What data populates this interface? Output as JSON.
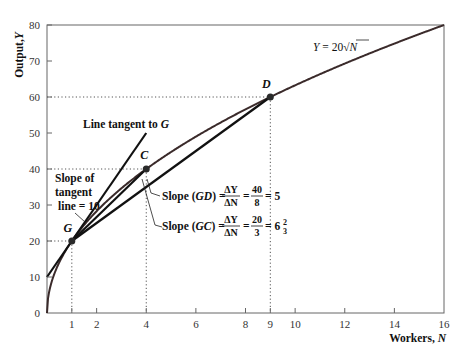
{
  "chart_data": {
    "type": "line",
    "title": "",
    "xlabel": "Workers, N",
    "ylabel": "Output, Y",
    "xlim": [
      0,
      16
    ],
    "ylim": [
      0,
      80
    ],
    "x_ticks": [
      "1",
      "2",
      "4",
      "6",
      "8",
      "9",
      "10",
      "12",
      "14",
      "16"
    ],
    "y_ticks": [
      "0",
      "10",
      "20",
      "30",
      "40",
      "50",
      "60",
      "70",
      "80"
    ],
    "x_tick_values": [
      1,
      2,
      4,
      6,
      8,
      9,
      10,
      12,
      14,
      16
    ],
    "y_tick_values": [
      0,
      10,
      20,
      30,
      40,
      50,
      60,
      70,
      80
    ],
    "grid": false,
    "series": [
      {
        "name": "Y = 20√N",
        "function": "20*sqrt(N)",
        "x": [
          0,
          1,
          2,
          4,
          6,
          8,
          9,
          10,
          12,
          14,
          16
        ],
        "values": [
          0,
          20,
          28.3,
          40,
          49,
          56.6,
          60,
          63.2,
          69.3,
          74.8,
          80
        ]
      },
      {
        "name": "Line tangent to G",
        "x": [
          0,
          4
        ],
        "values": [
          10,
          50
        ],
        "slope": 10
      },
      {
        "name": "Line GC",
        "x": [
          1,
          4
        ],
        "values": [
          20,
          40
        ],
        "slope": 6.67
      },
      {
        "name": "Line GD",
        "x": [
          1,
          9
        ],
        "values": [
          20,
          60
        ],
        "slope": 5
      }
    ],
    "points": [
      {
        "label": "G",
        "x": 1,
        "y": 20
      },
      {
        "label": "C",
        "x": 4,
        "y": 40
      },
      {
        "label": "D",
        "x": 9,
        "y": 60
      }
    ],
    "annotations": {
      "curve_label": {
        "lhs": "Y",
        "eq": " = 20",
        "sqrt_arg": "N"
      },
      "tangent_label": {
        "text": "Line tangent to ",
        "point": "G"
      },
      "tangent_slope": [
        "Slope of",
        "tangent",
        "line = 10"
      ],
      "slope_gd": {
        "prefix": "Slope (",
        "seg": "GD",
        "suffix": ") =",
        "dnum": "ΔY",
        "dden": "ΔN",
        "num": "40",
        "den": "8",
        "result": "= 5"
      },
      "slope_gc": {
        "prefix": "Slope (",
        "seg": "GC",
        "suffix": ") =",
        "dnum": "ΔY",
        "dden": "ΔN",
        "num": "20",
        "den": "3",
        "result_whole": "6",
        "result_num": "2",
        "result_den": "3"
      }
    }
  },
  "axes": {
    "x_title_main": "Workers, ",
    "x_title_var": "N",
    "y_title_main": "Output,",
    "y_title_var": "Y"
  }
}
